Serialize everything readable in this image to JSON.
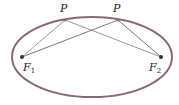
{
  "diagram": {
    "colors": {
      "ellipse": "#8a6a72",
      "lines": "#9a9a9a",
      "points": "#333333"
    },
    "ellipse": {
      "cx": 92,
      "cy": 57,
      "rx": 80,
      "ry": 40
    },
    "foci": [
      {
        "name": "F",
        "sub": "1",
        "x": 22,
        "y": 57
      },
      {
        "name": "F",
        "sub": "2",
        "x": 161,
        "y": 57
      }
    ],
    "points": [
      {
        "name": "P",
        "x": 65,
        "y": 20
      },
      {
        "name": "P",
        "x": 118,
        "y": 20
      }
    ]
  }
}
